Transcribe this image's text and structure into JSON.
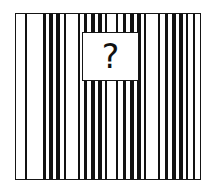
{
  "puzzle": {
    "type": "pattern-completion",
    "prompt_symbol": "?",
    "panel": {
      "x": 15,
      "y": 13,
      "width": 186,
      "height": 167,
      "border_color": "#151515",
      "background_color": "#ffffff"
    },
    "missing_piece_card": {
      "x": 82,
      "y": 32,
      "width": 57,
      "height": 49,
      "border_color": "#161616",
      "background_color": "#ffffff",
      "label": "?"
    },
    "stripe_color": "#111111",
    "gap_color": "#ffffff"
  },
  "chart_data": {
    "type": "bar",
    "title": "",
    "subtitle": "",
    "xlabel": "",
    "ylabel": "",
    "grid": false,
    "legend": null,
    "orientation": "vertical-stripes",
    "axis_units": "pixels-from-panel-left",
    "xlim": [
      0,
      186
    ],
    "stripe_color": "#111111",
    "categories": [
      "s1",
      "s2",
      "s3",
      "s4",
      "s5",
      "s6",
      "s7",
      "s8",
      "s9",
      "s10",
      "s11",
      "s12",
      "s13",
      "s14",
      "s15",
      "s16",
      "s17",
      "s18",
      "s19",
      "s20",
      "s21",
      "s22"
    ],
    "series": [
      {
        "name": "stripe_left_edge",
        "values": [
          9,
          27,
          33,
          40,
          48,
          62,
          68,
          75,
          82,
          89,
          100,
          107,
          114,
          121,
          128,
          142,
          149,
          156,
          163,
          170,
          177,
          0
        ]
      },
      {
        "name": "stripe_width",
        "values": [
          2,
          3,
          4,
          4,
          2,
          2,
          3,
          4,
          4,
          2,
          2,
          3,
          4,
          4,
          2,
          2,
          3,
          4,
          4,
          2,
          2,
          0
        ]
      }
    ],
    "stripes": [
      {
        "x": 9,
        "w": 2
      },
      {
        "x": 27,
        "w": 3
      },
      {
        "x": 33,
        "w": 4
      },
      {
        "x": 40,
        "w": 4
      },
      {
        "x": 48,
        "w": 2
      },
      {
        "x": 62,
        "w": 2
      },
      {
        "x": 68,
        "w": 3
      },
      {
        "x": 75,
        "w": 4
      },
      {
        "x": 82,
        "w": 4
      },
      {
        "x": 89,
        "w": 2
      },
      {
        "x": 100,
        "w": 2
      },
      {
        "x": 107,
        "w": 3
      },
      {
        "x": 114,
        "w": 4
      },
      {
        "x": 121,
        "w": 4
      },
      {
        "x": 128,
        "w": 2
      },
      {
        "x": 142,
        "w": 2
      },
      {
        "x": 149,
        "w": 3
      },
      {
        "x": 156,
        "w": 4
      },
      {
        "x": 163,
        "w": 4
      },
      {
        "x": 170,
        "w": 2
      },
      {
        "x": 177,
        "w": 2
      }
    ]
  }
}
